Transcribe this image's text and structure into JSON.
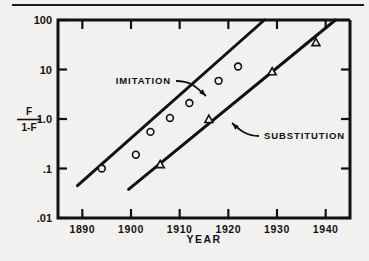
{
  "figure": {
    "background_color": "#f2f1ef",
    "ink_color": "#111111",
    "has_top_rule": true
  },
  "chart_data": {
    "type": "scatter",
    "title": "",
    "xlabel": "YEAR",
    "ylabel": "F / 1-F",
    "ylabel_numerator": "F",
    "ylabel_denominator": "1-F",
    "xlim": [
      1885,
      1945
    ],
    "ylim": [
      0.01,
      100
    ],
    "yscale": "log",
    "grid": false,
    "legend_position": "inline-annotations",
    "xticks": [
      1890,
      1900,
      1910,
      1920,
      1930,
      1940
    ],
    "xtick_labels": [
      "1890",
      "1900",
      "1910",
      "1920",
      "1930",
      "1940"
    ],
    "yticks": [
      0.01,
      0.1,
      1.0,
      10,
      100
    ],
    "ytick_labels": [
      ".01",
      ".1",
      "1.0",
      "10",
      "100"
    ],
    "series": [
      {
        "name": "IMITATION",
        "marker": "circle",
        "label_x": 1900.5,
        "label_y": 6.0,
        "fit_line": {
          "x": [
            1889.0,
            1927.4
          ],
          "y": [
            0.045,
            100
          ]
        },
        "points": [
          {
            "x": 1894,
            "y": 0.1
          },
          {
            "x": 1901,
            "y": 0.19
          },
          {
            "x": 1904,
            "y": 0.55
          },
          {
            "x": 1908,
            "y": 1.05
          },
          {
            "x": 1912,
            "y": 2.1
          },
          {
            "x": 1918,
            "y": 5.9
          },
          {
            "x": 1922,
            "y": 11.5
          }
        ]
      },
      {
        "name": "SUBSTITUTION",
        "marker": "triangle",
        "label_x": 1921.0,
        "label_y": 0.62,
        "fit_line": {
          "x": [
            1899.5,
            1942.0
          ],
          "y": [
            0.038,
            100
          ]
        },
        "points": [
          {
            "x": 1906,
            "y": 0.12
          },
          {
            "x": 1916,
            "y": 0.98
          },
          {
            "x": 1929,
            "y": 9.0
          },
          {
            "x": 1938,
            "y": 35.0
          }
        ]
      }
    ]
  }
}
